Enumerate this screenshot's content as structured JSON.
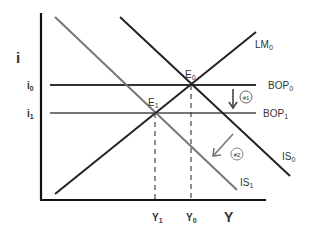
{
  "diagram": {
    "type": "IS-LM-BOP",
    "axes": {
      "y_label": "i",
      "x_label": "Y"
    },
    "y_ticks": [
      {
        "base": "i",
        "sub": "0"
      },
      {
        "base": "i",
        "sub": "1"
      }
    ],
    "x_ticks": [
      {
        "base": "Y",
        "sub": "1"
      },
      {
        "base": "Y",
        "sub": "0"
      }
    ],
    "curves": {
      "lm0": {
        "base": "LM",
        "sub": "0"
      },
      "bop0": {
        "base": "BOP",
        "sub": "0"
      },
      "bop1": {
        "base": "BOP",
        "sub": "1"
      },
      "is0": {
        "base": "IS",
        "sub": "0"
      },
      "is1": {
        "base": "IS",
        "sub": "1"
      }
    },
    "points": {
      "e0": {
        "base": "E",
        "sub": "0"
      },
      "e1": {
        "base": "E",
        "sub": "1"
      }
    },
    "steps": {
      "step1": "#1",
      "step2": "#2"
    },
    "colors": {
      "black_line": "#222222",
      "gray_line": "#777777",
      "label": "#333333"
    }
  }
}
